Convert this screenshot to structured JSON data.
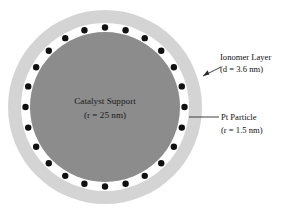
{
  "figure": {
    "background_color": "#ffffff"
  },
  "core": {
    "name": "Catalyst Support",
    "label_line1": "Catalyst Support",
    "label_line2": "(r = 25 nm)",
    "radius_nm": 25,
    "color": "#8c8c8c"
  },
  "ionomer": {
    "name": "Ionomer Layer",
    "label_line1": "Ionomer Layer",
    "label_line2": "(d = 3.6 nm)",
    "thickness_nm": 3.6,
    "color": "#d4d4d4"
  },
  "particles": {
    "name": "Pt Particle",
    "label_line1": "Pt Particle",
    "label_line2": "(r = 1.5 nm)",
    "radius_nm": 1.5,
    "color": "#111111",
    "count": 24
  },
  "gap": {
    "color": "#ffffff"
  },
  "geometry": {
    "center_x": 105,
    "center_y": 107,
    "outer_r": 97,
    "gap_outer_r": 84,
    "dot_ring_r": 79.5,
    "core_r": 75,
    "dot_r": 3.2
  }
}
